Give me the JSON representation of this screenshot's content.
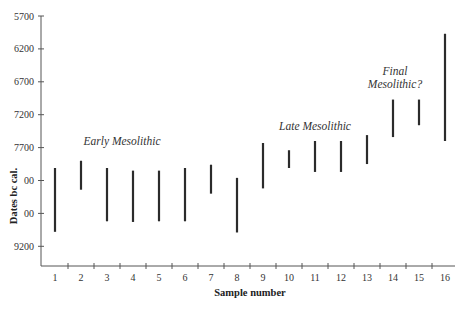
{
  "chart_data": {
    "type": "range-bar",
    "title": "",
    "xlabel": "Sample number",
    "ylabel": "Dates bc cal.",
    "y_inverted": true,
    "ylim": [
      5700,
      9500
    ],
    "yticks": [
      5700,
      6200,
      6700,
      7200,
      7700,
      8200,
      8700,
      9200
    ],
    "ytick_labels": [
      "5700",
      "6200",
      "6700",
      "7200",
      "7700",
      "00",
      "00",
      "9200"
    ],
    "categories": [
      "1",
      "2",
      "3",
      "4",
      "5",
      "6",
      "7",
      "8",
      "9",
      "10",
      "11",
      "12",
      "13",
      "14",
      "15",
      "16"
    ],
    "series": [
      {
        "name": "Date range",
        "ranges": [
          [
            8010,
            8980
          ],
          [
            7900,
            8340
          ],
          [
            8010,
            8820
          ],
          [
            8050,
            8830
          ],
          [
            8050,
            8820
          ],
          [
            8010,
            8820
          ],
          [
            7960,
            8400
          ],
          [
            8160,
            8990
          ],
          [
            7630,
            8320
          ],
          [
            7740,
            8010
          ],
          [
            7600,
            8070
          ],
          [
            7600,
            8070
          ],
          [
            7510,
            7950
          ],
          [
            6970,
            7540
          ],
          [
            6970,
            7360
          ],
          [
            5970,
            7600
          ]
        ]
      }
    ],
    "annotations": [
      {
        "text": "Early Mesolithic",
        "near_sample": 3,
        "value": 7620
      },
      {
        "text": "Late Mesolithic",
        "near_sample": 10.5,
        "value": 7500
      },
      {
        "text": "Final",
        "near_sample": 14.5,
        "value": 6620
      },
      {
        "text": "Mesolithic?",
        "near_sample": 14.5,
        "value": 6860
      }
    ],
    "grid": false,
    "legend": "none"
  }
}
